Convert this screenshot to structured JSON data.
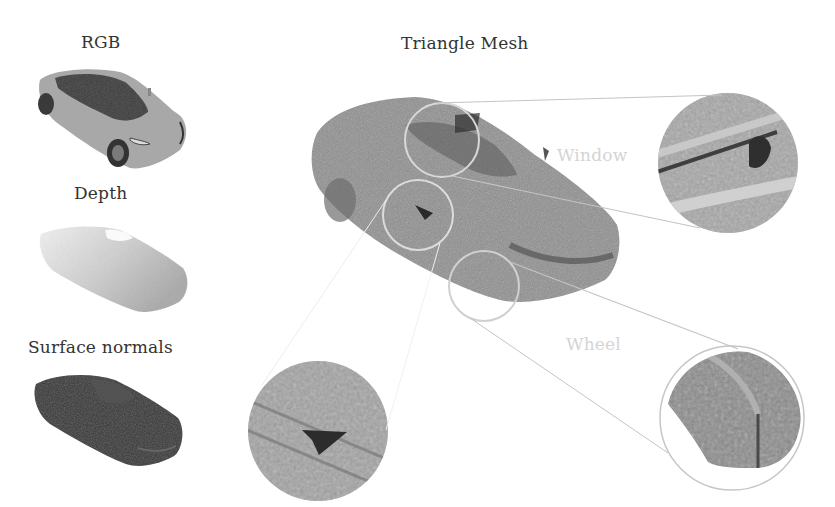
{
  "figure": {
    "left_column": [
      {
        "id": "rgb",
        "label": "RGB",
        "render": "rgb-car-render"
      },
      {
        "id": "depth",
        "label": "Depth",
        "render": "depth-car-render"
      },
      {
        "id": "normals",
        "label": "Surface normals",
        "render": "surface-normals-car-render"
      }
    ],
    "main": {
      "title": "Triangle Mesh",
      "render": "triangle-mesh-car-render"
    },
    "callouts": [
      {
        "id": "window",
        "label": "Window",
        "source_circle": {
          "cx": 442,
          "cy": 140,
          "r": 37
        },
        "zoom_circle": {
          "cx": 728,
          "cy": 163,
          "r": 71
        }
      },
      {
        "id": "door",
        "label": "",
        "source_circle": {
          "cx": 418,
          "cy": 215,
          "r": 35
        },
        "zoom_circle": {
          "cx": 317,
          "cy": 430,
          "r": 70
        }
      },
      {
        "id": "wheel",
        "label": "Wheel",
        "source_circle": {
          "cx": 484,
          "cy": 286,
          "r": 35
        },
        "zoom_circle": {
          "cx": 732,
          "cy": 418,
          "r": 72
        }
      }
    ],
    "colors": {
      "background": "#ffffff",
      "text": "#333333",
      "faint_label": "#d4d4d4",
      "callout_line": "#c8c8c8",
      "mesh_gray": "#8c8c8c",
      "rgb_body": "#a5a5a5",
      "rgb_glass": "#3a3a3a",
      "depth_gray": "#bdbdbd",
      "normals_dark": "#333333"
    }
  }
}
